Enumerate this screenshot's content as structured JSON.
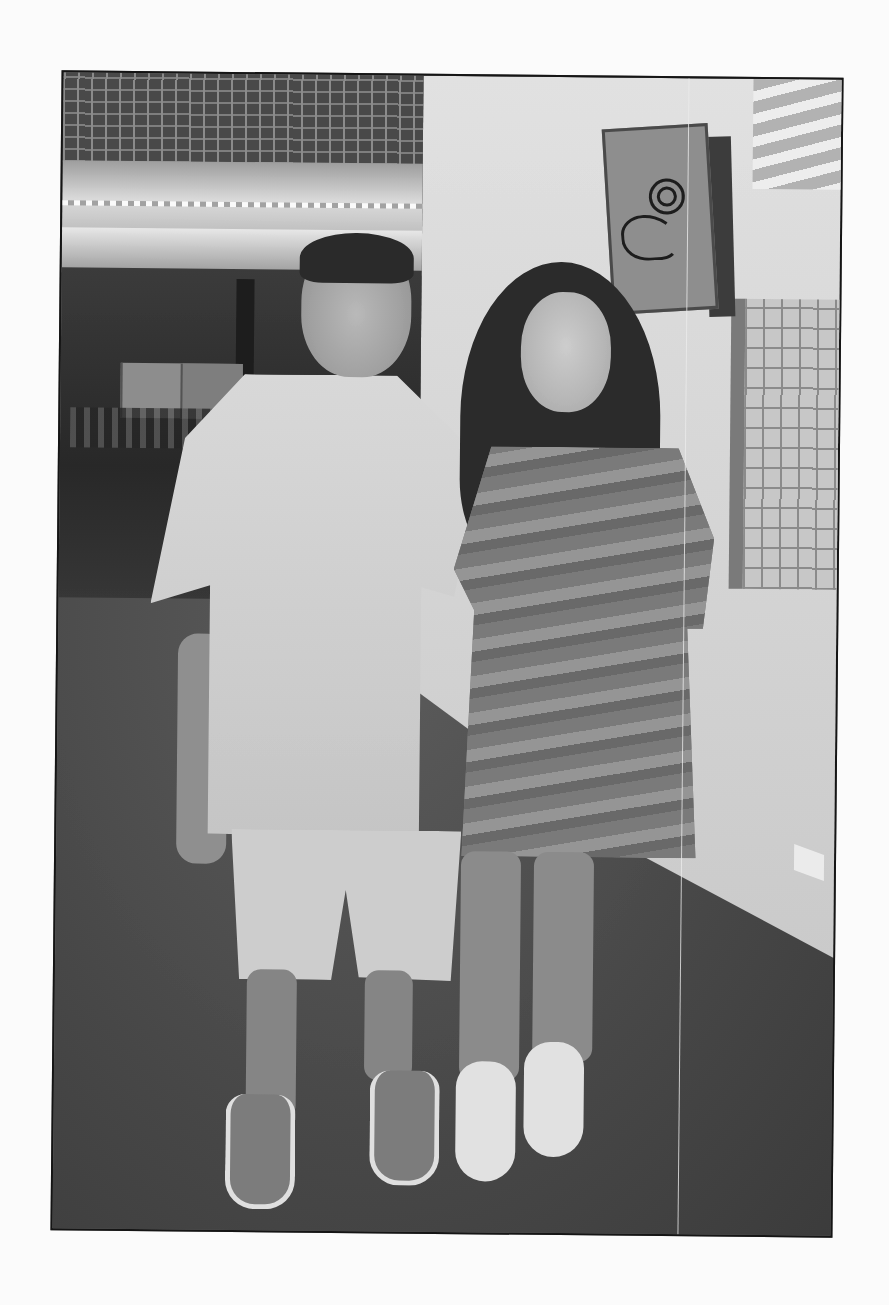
{
  "photo": {
    "description": "Grayscale scanned photograph of a man and a young woman posing together in a restaurant hallway",
    "subjects": [
      {
        "name": "man",
        "description": "smiling man in light short-sleeve button shirt and light shorts, with suede shoes"
      },
      {
        "name": "woman",
        "description": "smiling woman with long dark hair in a camouflage t-shirt dress and white sneakers, arm around the man"
      }
    ],
    "background": {
      "left": "restaurant dining area with illuminated ceiling lights and tables",
      "right": "wall with mounted southwestern-style petroglyph art panel and a stone-brick mural",
      "floor": "dark carpet"
    },
    "colors": {
      "page": "#fbfbfb",
      "frame_border": "#1a1a1a",
      "floor": "#4a4a4a",
      "wall": "#d0d0d0"
    }
  }
}
